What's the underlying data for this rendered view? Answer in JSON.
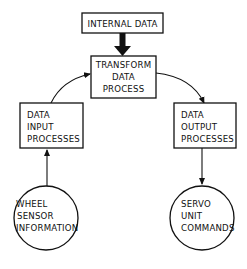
{
  "diagram": {
    "nodes": {
      "internal_data": {
        "lines": [
          "INTERNAL DATA"
        ],
        "shape": "rect"
      },
      "transform": {
        "lines": [
          "TRANSFORM",
          "DATA",
          "PROCESS"
        ],
        "shape": "rect"
      },
      "input": {
        "lines": [
          "DATA",
          "INPUT",
          "PROCESSES"
        ],
        "shape": "rect"
      },
      "output": {
        "lines": [
          "DATA",
          "OUTPUT",
          "PROCESSES"
        ],
        "shape": "rect"
      },
      "wheel": {
        "lines": [
          "WHEEL",
          "SENSOR",
          "INFORMATION"
        ],
        "shape": "circle"
      },
      "servo": {
        "lines": [
          "SERVO",
          "UNIT",
          "COMMANDS"
        ],
        "shape": "circle"
      }
    },
    "edges": [
      {
        "from": "internal_data",
        "to": "transform",
        "style": "thick"
      },
      {
        "from": "input",
        "to": "transform",
        "style": "curved"
      },
      {
        "from": "transform",
        "to": "output",
        "style": "curved"
      },
      {
        "from": "wheel",
        "to": "input",
        "style": "straight"
      },
      {
        "from": "output",
        "to": "servo",
        "style": "straight"
      }
    ],
    "colors": {
      "stroke": "#111111",
      "background": "#ffffff"
    }
  }
}
